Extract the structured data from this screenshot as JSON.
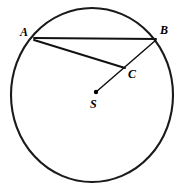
{
  "figure": {
    "kind": "circle-geometry-diagram",
    "background_color": "#ffffff",
    "stroke_color": "#111111",
    "canvas": {
      "width": 181,
      "height": 190
    },
    "circle": {
      "name": "main-circle",
      "center_x": 92,
      "center_y": 95,
      "radius_x": 81,
      "radius_y": 87,
      "stroke_width": 2.1
    },
    "points": [
      {
        "id": "A",
        "label": "A",
        "x": 34,
        "y": 39,
        "label_x": 20,
        "label_y": 26,
        "on_circle": true,
        "dot": false
      },
      {
        "id": "B",
        "label": "B",
        "x": 156,
        "y": 40,
        "label_x": 160,
        "label_y": 24,
        "on_circle": true,
        "dot": false
      },
      {
        "id": "C",
        "label": "C",
        "x": 124,
        "y": 67,
        "label_x": 128,
        "label_y": 68,
        "on_circle": false,
        "dot": false
      },
      {
        "id": "S",
        "label": "S",
        "x": 96,
        "y": 92,
        "label_x": 90,
        "label_y": 98,
        "on_circle": false,
        "dot": true
      }
    ],
    "segments": [
      {
        "id": "AB",
        "from": "A",
        "to": "B",
        "x1": 34,
        "y1": 38,
        "x2": 156,
        "y2": 39,
        "width": 1.9
      },
      {
        "id": "AC",
        "from": "A",
        "to": "C",
        "x1": 34,
        "y1": 40,
        "x2": 125,
        "y2": 68,
        "width": 1.9
      },
      {
        "id": "SB",
        "from": "S",
        "to": "B",
        "x1": 96,
        "y1": 92,
        "x2": 156,
        "y2": 40,
        "width": 1.5
      }
    ]
  }
}
